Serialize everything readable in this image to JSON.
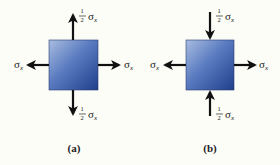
{
  "figure": {
    "panels": [
      {
        "id": "a",
        "caption": "(a)",
        "description": "Element under biaxial tension",
        "element_color": "#3a5fa8",
        "stresses": {
          "left": {
            "label": "σ",
            "sub": "x",
            "direction": "outward"
          },
          "right": {
            "label": "σ",
            "sub": "x",
            "direction": "outward"
          },
          "top": {
            "coef_num": "1",
            "coef_den": "2",
            "label": "σ",
            "sub": "x",
            "direction": "outward"
          },
          "bottom": {
            "coef_num": "1",
            "coef_den": "2",
            "label": "σ",
            "sub": "x",
            "direction": "outward"
          }
        }
      },
      {
        "id": "b",
        "caption": "(b)",
        "description": "Element under tension in x and compression in y",
        "element_color": "#3a5fa8",
        "stresses": {
          "left": {
            "label": "σ",
            "sub": "x",
            "direction": "outward"
          },
          "right": {
            "label": "σ",
            "sub": "x",
            "direction": "outward"
          },
          "top": {
            "coef_num": "1",
            "coef_den": "2",
            "label": "σ",
            "sub": "x",
            "direction": "inward"
          },
          "bottom": {
            "coef_num": "1",
            "coef_den": "2",
            "label": "σ",
            "sub": "x",
            "direction": "inward"
          }
        }
      }
    ]
  }
}
